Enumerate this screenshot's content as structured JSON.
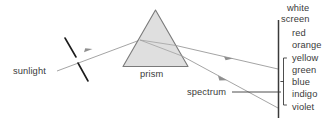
{
  "diagram": {
    "canvas": {
      "width": 330,
      "height": 124,
      "background": "#ffffff"
    },
    "labels": {
      "sunlight": "sunlight",
      "prism": "prism",
      "spectrum": "spectrum",
      "white": "white",
      "screen": "screen"
    },
    "spectrum_colors": [
      "red",
      "orange",
      "yellow",
      "green",
      "blue",
      "indigo",
      "violet"
    ],
    "colors": {
      "ray": "#9a9a9a",
      "prism_fill": "#d9d9d9",
      "prism_stroke": "#7a7a7a",
      "slit": "#1c1c1c",
      "screen": "#3a3a3a",
      "bracket": "#3a3a3a",
      "text": "#3a3a3a",
      "leader": "#3a3a3a"
    }
  }
}
